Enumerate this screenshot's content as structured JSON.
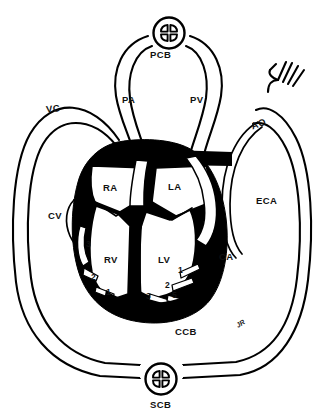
{
  "diagram": {
    "width": 322,
    "height": 418,
    "ink_color": "#000000",
    "background_color": "#ffffff"
  },
  "labels": {
    "pcb": {
      "text": "PCB",
      "x": 150,
      "y": 50,
      "meaning": "pulmonary capillary bed"
    },
    "pa": {
      "text": "PA",
      "x": 122,
      "y": 95,
      "meaning": "pulmonary artery"
    },
    "pv": {
      "text": "PV",
      "x": 190,
      "y": 95,
      "meaning": "pulmonary vein"
    },
    "vc": {
      "text": "VC",
      "x": 46,
      "y": 104,
      "meaning": "vena cava"
    },
    "ao": {
      "text": "AO",
      "x": 251,
      "y": 119,
      "meaning": "aorta"
    },
    "ra": {
      "text": "RA",
      "x": 103,
      "y": 183,
      "meaning": "right atrium"
    },
    "la": {
      "text": "LA",
      "x": 168,
      "y": 182,
      "meaning": "left atrium"
    },
    "eca": {
      "text": "ECA",
      "x": 256,
      "y": 196,
      "meaning": "extracardiac artery"
    },
    "cv": {
      "text": "CV",
      "x": 48,
      "y": 211,
      "meaning": "coronary vein"
    },
    "ca": {
      "text": "CA",
      "x": 219,
      "y": 252,
      "meaning": "coronary artery"
    },
    "rv": {
      "text": "RV",
      "x": 104,
      "y": 255,
      "meaning": "right ventricle"
    },
    "lv": {
      "text": "LV",
      "x": 158,
      "y": 255,
      "meaning": "left ventricle"
    },
    "ccb": {
      "text": "CCB",
      "x": 175,
      "y": 327,
      "meaning": "coronary capillary bed"
    },
    "scb": {
      "text": "SCB",
      "x": 150,
      "y": 400,
      "meaning": "systemic capillary bed"
    },
    "signature": {
      "text": "JR",
      "x": 236,
      "y": 320
    }
  },
  "markers": [
    {
      "id": "marker-left-3",
      "text": "3",
      "x": 86,
      "y": 240
    },
    {
      "id": "marker-left-2",
      "text": "2",
      "x": 91,
      "y": 273
    },
    {
      "id": "marker-left-1",
      "text": "1",
      "x": 106,
      "y": 288
    },
    {
      "id": "marker-center-3",
      "text": "3",
      "x": 146,
      "y": 292
    },
    {
      "id": "marker-right-2",
      "text": "2",
      "x": 165,
      "y": 281
    },
    {
      "id": "marker-right-small",
      "text": "5",
      "x": 172,
      "y": 291
    },
    {
      "id": "marker-right-1",
      "text": "1",
      "x": 178,
      "y": 266
    }
  ],
  "capillary_beds": [
    {
      "id": "pcb-node",
      "cx": 188,
      "cy": 33,
      "r": 16
    },
    {
      "id": "scb-node",
      "cx": 161,
      "cy": 379,
      "r": 16
    }
  ]
}
